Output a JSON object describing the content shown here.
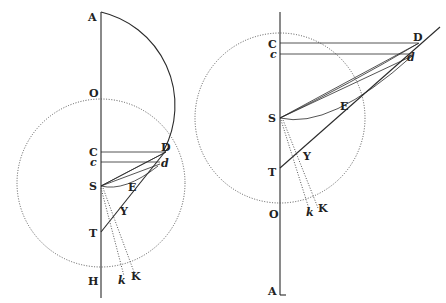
{
  "header_fragment": "",
  "figures": [
    {
      "id": "left",
      "labels": {
        "A": "A",
        "O": "O",
        "C": "C",
        "c": "c",
        "D": "D",
        "d": "d",
        "S": "S",
        "E": "E",
        "Y": "Y",
        "T": "T",
        "H": "H",
        "k": "k",
        "K": "K"
      }
    },
    {
      "id": "right",
      "labels": {
        "C": "C",
        "c": "c",
        "D": "D",
        "d": "d",
        "S": "S",
        "E": "E",
        "Y": "Y",
        "T": "T",
        "O": "O",
        "k": "k",
        "K": "K",
        "A": "A"
      }
    }
  ]
}
